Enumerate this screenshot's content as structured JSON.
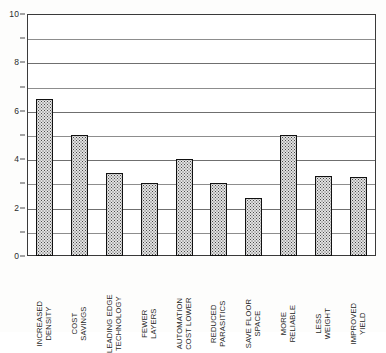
{
  "chart_data": {
    "type": "bar",
    "title": "",
    "subtitle": "",
    "xlabel": "",
    "ylabel": "",
    "ylim": [
      0,
      10
    ],
    "xlim": null,
    "grid": true,
    "grid_axis": "y",
    "legend": false,
    "legend_position": "none",
    "orientation": "vertical",
    "categories": [
      "INCREASED DENSITY",
      "COST SAVINGS",
      "LEADING EDGE TECHNOLOGY",
      "FEWER LAYERS",
      "AUTOMATION COST LOWER",
      "REDUCED PARASITICS",
      "SAVE FLOOR SPACE",
      "MORE RELIABLE",
      "LESS WEIGHT",
      "IMPROVED YIELD"
    ],
    "category_lines": [
      [
        "INCREASED",
        "DENSITY"
      ],
      [
        "COST",
        "SAVINGS"
      ],
      [
        "LEADING EDGE",
        "TECHNOLOGY"
      ],
      [
        "FEWER",
        "LAYERS"
      ],
      [
        "AUTOMATION",
        "COST LOWER"
      ],
      [
        "REDUCED",
        "PARASITICS"
      ],
      [
        "SAVE FLOOR",
        "SPACE"
      ],
      [
        "MORE",
        "RELIABLE"
      ],
      [
        "LESS",
        "WEIGHT"
      ],
      [
        "IMPROVED",
        "YIELD"
      ]
    ],
    "values": [
      6.5,
      5.0,
      3.45,
      3.0,
      4.0,
      3.0,
      2.4,
      5.0,
      3.3,
      3.25
    ],
    "y_ticks_major": [
      0,
      2,
      4,
      6,
      8,
      10
    ],
    "y_ticks_minor": [
      1,
      3,
      5,
      7,
      9
    ],
    "y_tick_labels": [
      "0",
      "2",
      "4",
      "6",
      "8",
      "10"
    ],
    "bar_fill_color": "#e2e2e2",
    "bar_edge_color": "#111111",
    "bar_pattern": "stipple-dots",
    "gridline_color": "#8d8d8d",
    "axis_color": "#3a3a3a",
    "background_color": "#ffffff"
  }
}
